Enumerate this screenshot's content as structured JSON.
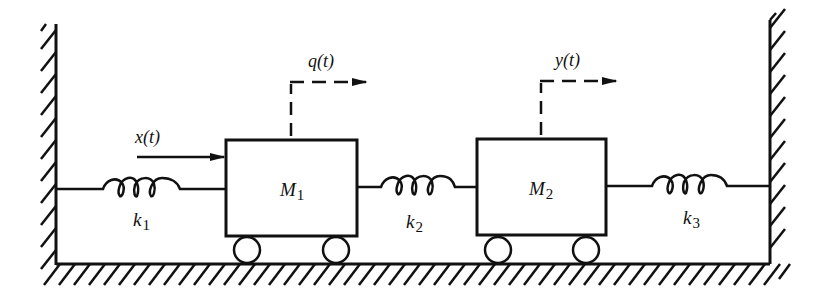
{
  "diagram": {
    "type": "two-mass spring system",
    "colors": {
      "stroke": "#111111",
      "background": "#ffffff"
    },
    "walls": [
      {
        "id": "left-wall",
        "x": 56,
        "y1": 24,
        "y2": 264,
        "hatch_side": "left"
      },
      {
        "id": "right-wall",
        "x": 770,
        "y1": 20,
        "y2": 264,
        "hatch_side": "right"
      }
    ],
    "floor": {
      "y": 264,
      "x1": 56,
      "x2": 770
    },
    "masses": [
      {
        "id": "M1",
        "label_main": "M",
        "label_sub": "1",
        "x": 226,
        "y": 140,
        "w": 131,
        "h": 96
      },
      {
        "id": "M2",
        "label_main": "M",
        "label_sub": "2",
        "x": 477,
        "y": 139,
        "w": 129,
        "h": 96
      }
    ],
    "springs": [
      {
        "id": "k1",
        "label_main": "k",
        "label_sub": "1"
      },
      {
        "id": "k2",
        "label_main": "k",
        "label_sub": "2"
      },
      {
        "id": "k3",
        "label_main": "k",
        "label_sub": "3"
      }
    ],
    "input_force": {
      "label": "x(t)"
    },
    "displacements": [
      {
        "id": "q",
        "label": "q(t)",
        "mass": "M1"
      },
      {
        "id": "y",
        "label": "y(t)",
        "mass": "M2"
      }
    ]
  }
}
